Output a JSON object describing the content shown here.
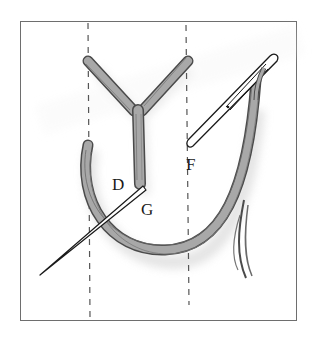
{
  "figure": {
    "labels": {
      "D": "D",
      "G": "G",
      "F": "F"
    },
    "colors": {
      "frame": "#6e6e6e",
      "guide_line": "#555555",
      "thread_fill": "#a8a8a8",
      "thread_outline": "#4a4a4a",
      "thread_shadow": "#e3e3e3",
      "needle_fill": "#ffffff",
      "needle_outline": "#1a1a1a"
    }
  }
}
